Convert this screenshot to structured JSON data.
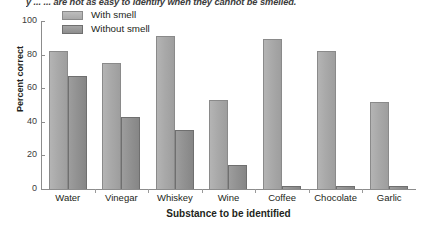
{
  "caption": {
    "text": "y ... ... are not as easy to identify when they cannot be smelled."
  },
  "legend": {
    "position": "top-left-inside",
    "items": [
      {
        "label": "With smell",
        "swatch": "light-gray-bar-swatch",
        "color": "#a9a9a9"
      },
      {
        "label": "Without smell",
        "swatch": "dark-gray-bar-swatch",
        "color": "#8e8e8e"
      }
    ]
  },
  "axes": {
    "y_title": "Percent correct",
    "x_title": "Substance to be identified",
    "y_ticks": [
      "0",
      "20",
      "40",
      "60",
      "80",
      "100"
    ]
  },
  "chart_data": {
    "type": "bar",
    "title": "",
    "subtitle": "",
    "xlabel": "Substance to be identified",
    "ylabel": "Percent correct",
    "ylim": [
      0,
      100
    ],
    "yticks": [
      0,
      20,
      40,
      60,
      80,
      100
    ],
    "grid": false,
    "legend_position": "upper left (inside plot)",
    "categories": [
      "Water",
      "Vinegar",
      "Whiskey",
      "Wine",
      "Coffee",
      "Chocolate",
      "Garlic"
    ],
    "series": [
      {
        "name": "With smell",
        "color": "#a9a9a9",
        "values": [
          82,
          75,
          91,
          53,
          89,
          82,
          52
        ]
      },
      {
        "name": "Without smell",
        "color": "#8e8e8e",
        "values": [
          67,
          43,
          35,
          14,
          2,
          2,
          2
        ]
      }
    ],
    "annotations": [
      "y ... ... are not as easy to identify when they cannot be smelled."
    ]
  }
}
